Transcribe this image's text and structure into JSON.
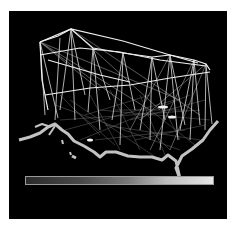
{
  "figure": {
    "background_color": "#000000",
    "line_color": "#e8e8e8",
    "colorbar": {
      "orientation": "horizontal",
      "gradient": [
        "#2b2b2b",
        "#4a4a4a",
        "#7a7a7a",
        "#bdbdbd",
        "#e6e6e6"
      ]
    },
    "hubs": [
      {
        "x": 71,
        "y": 29
      },
      {
        "x": 93,
        "y": 48
      },
      {
        "x": 123,
        "y": 53
      },
      {
        "x": 152,
        "y": 57
      },
      {
        "x": 170,
        "y": 55
      },
      {
        "x": 194,
        "y": 60
      },
      {
        "x": 206,
        "y": 64
      },
      {
        "x": 40,
        "y": 42
      }
    ]
  }
}
